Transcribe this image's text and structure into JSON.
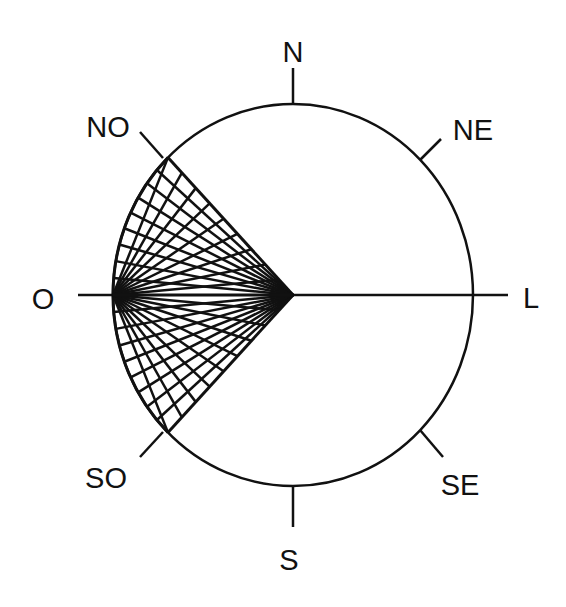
{
  "diagram": {
    "type": "compass-rose",
    "colors": {
      "stroke": "#111111",
      "background": "#ffffff"
    },
    "circle": {
      "cx": 293,
      "cy": 295,
      "rx": 180,
      "ry": 191
    },
    "labels": {
      "N": "N",
      "NE": "NE",
      "L": "L",
      "SE": "SE",
      "S": "S",
      "SO": "SO",
      "O": "O",
      "NO": "NO"
    },
    "wedge": {
      "from_direction": "NO",
      "to_direction": "SO",
      "apex": "center",
      "fan_point": "O",
      "line_count_per_family": 9
    }
  }
}
